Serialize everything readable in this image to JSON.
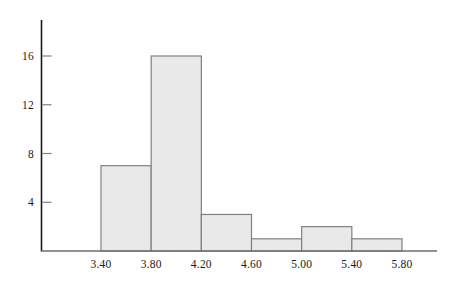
{
  "chart_data": {
    "type": "bar",
    "title": "",
    "subtitle": "",
    "xlabel": "",
    "ylabel": "",
    "bin_edges": [
      3.4,
      3.8,
      4.2,
      4.6,
      5.0,
      5.4,
      5.8
    ],
    "categories": [
      "3.40-3.80",
      "3.80-4.20",
      "4.20-4.60",
      "4.60-5.00",
      "5.00-5.40",
      "5.40-5.80"
    ],
    "values": [
      7,
      16,
      3,
      1,
      2,
      1
    ],
    "xtick_labels": [
      "3.40",
      "3.80",
      "4.20",
      "4.60",
      "5.00",
      "5.40",
      "5.80"
    ],
    "xtick_values": [
      3.4,
      3.8,
      4.2,
      4.6,
      5.0,
      5.4,
      5.8
    ],
    "ytick_labels": [
      "4",
      "8",
      "12",
      "16"
    ],
    "ytick_values": [
      4,
      8,
      12,
      16
    ],
    "xlim": [
      3.2,
      6.1
    ],
    "ylim": [
      0,
      18.0
    ],
    "grid": false,
    "legend": null,
    "bar_fill_color": "#e9e9e9",
    "bar_edge_color": "#808080",
    "axis_color": "#1a1a1a",
    "tick_color": "#808080",
    "background_color": "#ffffff"
  }
}
